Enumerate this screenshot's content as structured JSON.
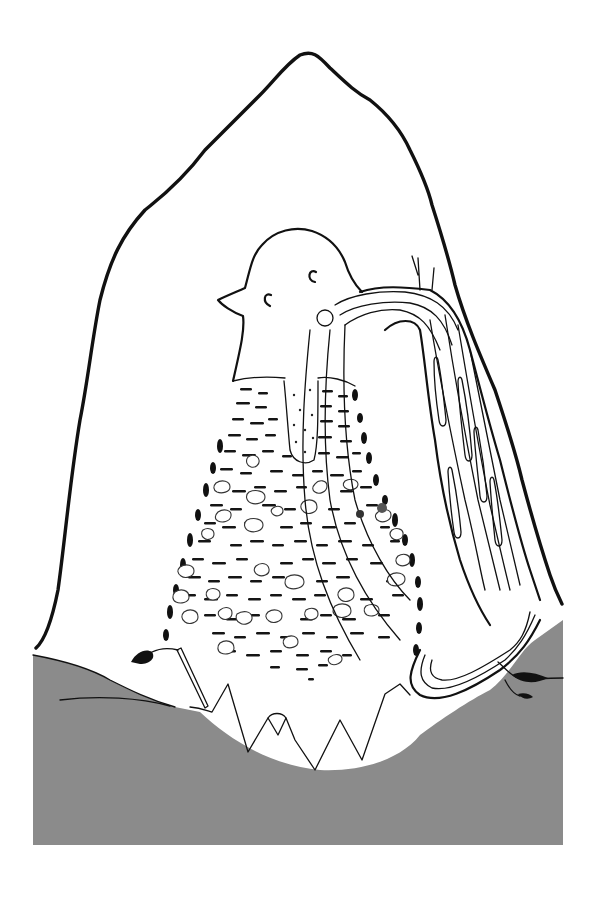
{
  "figure": {
    "colors": {
      "background": "#ffffff",
      "ink": "#111111",
      "ground": "#8a8a8a",
      "ground_line": "#222222"
    },
    "elements": [
      {
        "name": "mountain-outline"
      },
      {
        "name": "bird-head"
      },
      {
        "name": "sediment-body"
      },
      {
        "name": "central-pale-column"
      },
      {
        "name": "banded-tube"
      },
      {
        "name": "jagged-base"
      },
      {
        "name": "ground-layer"
      },
      {
        "name": "left-leaf-marker"
      },
      {
        "name": "right-crack"
      }
    ]
  }
}
